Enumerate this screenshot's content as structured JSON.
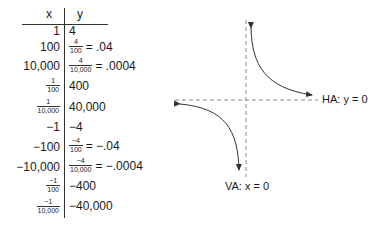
{
  "table": {
    "headers": {
      "x": "x",
      "y": "y"
    },
    "rows": [
      {
        "x": "1",
        "y": "4"
      },
      {
        "x": "100",
        "y_frac": {
          "num": "4",
          "den": "100"
        },
        "y": "= .04"
      },
      {
        "x": "10,000",
        "y_frac": {
          "num": "4",
          "den": "10,000"
        },
        "y": "= .0004"
      },
      {
        "x_frac": {
          "num": "1",
          "den": "100"
        },
        "y": "400"
      },
      {
        "x_frac": {
          "num": "1",
          "den": "10,000"
        },
        "y": "40,000"
      },
      {
        "x": "−1",
        "y": "−4"
      },
      {
        "x": "−100",
        "y_frac": {
          "num": "−4",
          "den": "100"
        },
        "y": "= −.04"
      },
      {
        "x": "−10,000",
        "y_frac": {
          "num": "−4",
          "den": "10,000"
        },
        "y": "= −.0004"
      },
      {
        "x_frac": {
          "num": "−1",
          "den": "100"
        },
        "y": "−400"
      },
      {
        "x_frac": {
          "num": "−1",
          "den": "10,000"
        },
        "y": "−40,000"
      }
    ]
  },
  "graph": {
    "function": "y = 4/x",
    "horizontal_asymptote_label": "HA: y = 0",
    "vertical_asymptote_label": "VA: x = 0",
    "line_color": "#333333",
    "asymptote_color": "#888888"
  }
}
